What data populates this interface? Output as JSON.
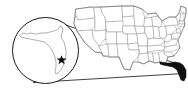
{
  "figure": {
    "type": "locator-map",
    "background_color": "#ffffff"
  },
  "main_map": {
    "name": "United States",
    "outline_color": "#8a8a8a",
    "fill_color": "#ffffff",
    "highlighted_region": {
      "name": "Florida",
      "fill_color": "#111111",
      "stroke_color": "#000000"
    }
  },
  "inset": {
    "name": "Florida magnified inset",
    "shape": "circle",
    "border_color": "#000000",
    "fill_color": "#ffffff",
    "region_name": "Florida",
    "region_outline_color": "#6f6f6f",
    "marker": {
      "icon": "star-marker",
      "color": "#000000",
      "location_description": "southeastern Florida coast"
    }
  },
  "connector": {
    "name": "magnifier leader lines",
    "color": "#000000",
    "count": 2
  }
}
